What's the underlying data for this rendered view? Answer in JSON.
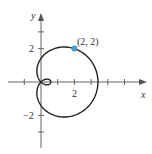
{
  "chart_data": {
    "type": "line",
    "title": "",
    "xlabel": "x",
    "ylabel": "y",
    "x_ticks": [
      -1,
      1,
      2,
      3,
      4,
      5
    ],
    "x_tick_labels": [
      {
        "value": 2,
        "label": "2"
      }
    ],
    "y_ticks": [
      3,
      2,
      -2,
      -3
    ],
    "y_tick_labels": [
      {
        "value": 2,
        "label": "2"
      },
      {
        "value": -2,
        "label": "−2"
      }
    ],
    "xlim": [
      -1.5,
      6.3
    ],
    "ylim": [
      -3.9,
      4.3
    ],
    "curve": {
      "a": 1.41,
      "b": 2.0,
      "samples": 240
    },
    "highlighted_point": {
      "x": 2,
      "y": 2,
      "label": "(2, 2)",
      "color": "#3aa0d5"
    },
    "grid": false
  },
  "labels": {
    "x_axis": "x",
    "y_axis": "y",
    "tick_2x": "2",
    "tick_2y": "2",
    "tick_m2y": "−2",
    "point": "(2, 2)"
  }
}
